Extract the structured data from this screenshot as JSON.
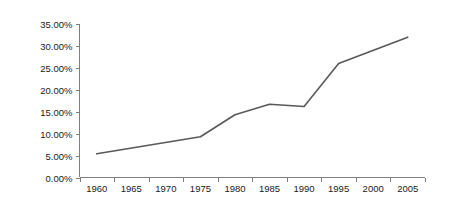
{
  "chart_data": {
    "type": "line",
    "title": "",
    "subtitle": "",
    "xlabel": "",
    "ylabel": "",
    "x": [
      1960,
      1975,
      1980,
      1985,
      1990,
      1995,
      2005
    ],
    "series": [
      {
        "name": "",
        "values": [
          5.4,
          9.3,
          14.3,
          16.7,
          16.2,
          26.0,
          32.0
        ]
      }
    ],
    "x_tick_labels": [
      "1960",
      "1965",
      "1970",
      "1975",
      "1980",
      "1985",
      "1990",
      "1995",
      "2000",
      "2005"
    ],
    "x_tick_values": [
      1960,
      1965,
      1970,
      1975,
      1980,
      1985,
      1990,
      1995,
      2000,
      2005
    ],
    "y_tick_labels": [
      "0.00%",
      "5.00%",
      "10.00%",
      "15.00%",
      "20.00%",
      "25.00%",
      "30.00%",
      "35.00%"
    ],
    "y_tick_values": [
      0,
      5,
      10,
      15,
      20,
      25,
      30,
      35
    ],
    "xlim": [
      1957.5,
      2007.5
    ],
    "ylim": [
      0,
      35
    ],
    "grid": false,
    "legend": false,
    "legend_position": "none",
    "colors": {
      "series_line": "#595959",
      "axis": "#808080",
      "tick_text": "#1a1a1a",
      "background": "#ffffff"
    },
    "annotations": []
  }
}
